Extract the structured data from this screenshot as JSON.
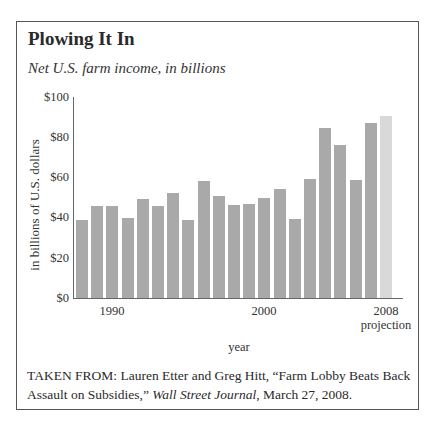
{
  "header": {
    "title": "Plowing It In",
    "subtitle": "Net U.S. farm income, in billions"
  },
  "axes": {
    "ylabel": "in billions of U.S. dollars",
    "xlabel": "year",
    "yticks": [
      "$100",
      "$80",
      "$60",
      "$40",
      "$20",
      "$0"
    ],
    "xticks": [
      {
        "label": "1990",
        "sub": ""
      },
      {
        "label": "2000",
        "sub": ""
      },
      {
        "label": "2008",
        "sub": "projection"
      }
    ]
  },
  "source": {
    "prefix": "TAKEN FROM: Lauren Etter and Greg Hitt, “Farm Lobby Beats Back Assault on Subsidies,” ",
    "publication": "Wall Street Journal",
    "suffix": ", March 27, 2008."
  },
  "colors": {
    "bar": "#a9a9a9",
    "projection_bar": "#d9d9d9",
    "frame": "#555555"
  },
  "chart_data": {
    "type": "bar",
    "title": "Plowing It In",
    "subtitle": "Net U.S. farm income, in billions",
    "xlabel": "year",
    "ylabel": "in billions of U.S. dollars",
    "ylim": [
      0,
      100
    ],
    "yticks": [
      0,
      20,
      40,
      60,
      80,
      100
    ],
    "xtick_labels": [
      "1990",
      "2000",
      "2008 projection"
    ],
    "grid": false,
    "legend": null,
    "categories": [
      "1988",
      "1989",
      "1990",
      "1991",
      "1992",
      "1993",
      "1994",
      "1995",
      "1996",
      "1997",
      "1998",
      "1999",
      "2000",
      "2001",
      "2002",
      "2003",
      "2004",
      "2005",
      "2006",
      "2007",
      "2008"
    ],
    "values": [
      39,
      46,
      46,
      40,
      49.5,
      46,
      52,
      39,
      58,
      50.5,
      46.5,
      47,
      50,
      54,
      39.5,
      59,
      84.5,
      76,
      58.5,
      87,
      90.5
    ],
    "projected": [
      false,
      false,
      false,
      false,
      false,
      false,
      false,
      false,
      false,
      false,
      false,
      false,
      false,
      false,
      false,
      false,
      false,
      false,
      false,
      false,
      true
    ],
    "annotations": [
      "2008 projection"
    ],
    "source": "TAKEN FROM: Lauren Etter and Greg Hitt, “Farm Lobby Beats Back Assault on Subsidies,” Wall Street Journal, March 27, 2008."
  }
}
